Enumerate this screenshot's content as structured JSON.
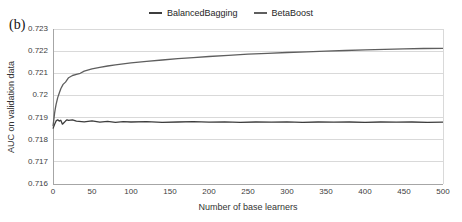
{
  "figure_label": "(b)",
  "legend": [
    {
      "label": "BalancedBagging",
      "color": "#3d3d3d"
    },
    {
      "label": "BetaBoost",
      "color": "#5e5e5e"
    }
  ],
  "chart_data": {
    "type": "line",
    "title": "",
    "xlabel": "Number of base learners",
    "ylabel": "AUC on validation data",
    "xlim": [
      0,
      500
    ],
    "ylim": [
      0.716,
      0.723
    ],
    "x_ticks": [
      0,
      50,
      100,
      150,
      200,
      250,
      300,
      350,
      400,
      450,
      500
    ],
    "y_ticks": [
      0.716,
      0.717,
      0.718,
      0.719,
      0.72,
      0.721,
      0.722,
      0.723
    ],
    "y_tick_labels": [
      "0.716",
      "0.717",
      "0.718",
      "0.719",
      "0.72",
      "0.721",
      "0.722",
      "0.723"
    ],
    "grid": "horizontal-only",
    "legend_position": "top-center",
    "series": [
      {
        "name": "BalancedBagging",
        "color": "#3d3d3d",
        "points": [
          [
            0,
            0.7185
          ],
          [
            2,
            0.7187
          ],
          [
            4,
            0.71885
          ],
          [
            6,
            0.7189
          ],
          [
            8,
            0.71884
          ],
          [
            10,
            0.71888
          ],
          [
            12,
            0.7187
          ],
          [
            14,
            0.71877
          ],
          [
            16,
            0.71884
          ],
          [
            18,
            0.7189
          ],
          [
            20,
            0.71887
          ],
          [
            25,
            0.7189
          ],
          [
            30,
            0.71884
          ],
          [
            40,
            0.71881
          ],
          [
            50,
            0.71885
          ],
          [
            60,
            0.71879
          ],
          [
            70,
            0.71883
          ],
          [
            80,
            0.71878
          ],
          [
            90,
            0.71882
          ],
          [
            100,
            0.7188
          ],
          [
            120,
            0.71882
          ],
          [
            140,
            0.71878
          ],
          [
            160,
            0.7188
          ],
          [
            180,
            0.71882
          ],
          [
            200,
            0.71879
          ],
          [
            220,
            0.71881
          ],
          [
            240,
            0.71878
          ],
          [
            260,
            0.7188
          ],
          [
            280,
            0.71879
          ],
          [
            300,
            0.71881
          ],
          [
            320,
            0.71878
          ],
          [
            340,
            0.7188
          ],
          [
            360,
            0.71879
          ],
          [
            380,
            0.7188
          ],
          [
            400,
            0.71878
          ],
          [
            420,
            0.7188
          ],
          [
            440,
            0.71879
          ],
          [
            460,
            0.7188
          ],
          [
            480,
            0.71878
          ],
          [
            500,
            0.71879
          ]
        ]
      },
      {
        "name": "BetaBoost",
        "color": "#5e5e5e",
        "points": [
          [
            0,
            0.7186
          ],
          [
            1,
            0.7189
          ],
          [
            2,
            0.7192
          ],
          [
            3,
            0.7194
          ],
          [
            4,
            0.7196
          ],
          [
            6,
            0.7199
          ],
          [
            8,
            0.7201
          ],
          [
            10,
            0.7203
          ],
          [
            13,
            0.7205
          ],
          [
            16,
            0.7206
          ],
          [
            20,
            0.7208
          ],
          [
            25,
            0.7209
          ],
          [
            30,
            0.72095
          ],
          [
            35,
            0.721
          ],
          [
            40,
            0.7211
          ],
          [
            50,
            0.7212
          ],
          [
            60,
            0.72127
          ],
          [
            70,
            0.72133
          ],
          [
            80,
            0.72138
          ],
          [
            90,
            0.72143
          ],
          [
            100,
            0.72147
          ],
          [
            120,
            0.72154
          ],
          [
            140,
            0.7216
          ],
          [
            160,
            0.72166
          ],
          [
            180,
            0.72171
          ],
          [
            200,
            0.72176
          ],
          [
            225,
            0.72181
          ],
          [
            250,
            0.72186
          ],
          [
            275,
            0.7219
          ],
          [
            300,
            0.72194
          ],
          [
            325,
            0.72197
          ],
          [
            350,
            0.722
          ],
          [
            375,
            0.72203
          ],
          [
            400,
            0.72206
          ],
          [
            425,
            0.72208
          ],
          [
            450,
            0.7221
          ],
          [
            475,
            0.72212
          ],
          [
            500,
            0.72213
          ]
        ]
      }
    ]
  }
}
